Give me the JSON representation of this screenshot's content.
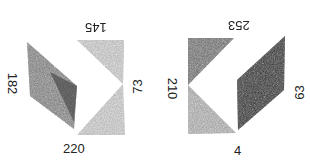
{
  "figure": {
    "left_group": {
      "labels": {
        "top": "145",
        "left": "182",
        "bottom": "220",
        "right": "73"
      }
    },
    "right_group": {
      "labels": {
        "top": "253",
        "left": "210",
        "bottom": "4",
        "right": "63"
      }
    }
  },
  "colors": {
    "light_shade": "#b8b8b8",
    "dark_shade": "#4a4a4a",
    "medium_shade": "#8a8a8a",
    "label_text": "#222222",
    "background": "#ffffff"
  }
}
